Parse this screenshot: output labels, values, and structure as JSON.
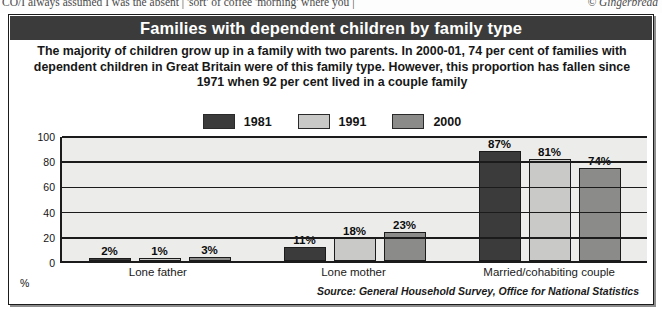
{
  "clipped_text": {
    "left": "CO/I always assumed I was the absent  |  'sort' of coffee 'morning' where you  |",
    "right": "© Gingerbread"
  },
  "headline": "Families with dependent children by family type",
  "standfirst": "The majority of children grow up in a family with two parents. In 2000-01, 74 per cent of families with dependent children in Great Britain were of this family type. However, this proportion has fallen since 1971 when 92 per cent lived in a couple family",
  "source": "Source: General Household Survey, Office for National Statistics",
  "colors": {
    "series_1981": "#3b3b3b",
    "series_1991": "#c9c9c7",
    "series_2000": "#8b8b8a",
    "headline_bar": "#3b3b3b",
    "plot_background": "#ececeb",
    "axis": "#1b1b1b"
  },
  "chart_data": {
    "type": "bar",
    "title": "Families with dependent children by family type",
    "xlabel": "",
    "ylabel": "%",
    "ylim": [
      0,
      100
    ],
    "yticks": [
      100,
      80,
      60,
      40,
      20,
      0
    ],
    "grid": true,
    "legend_position": "top-center",
    "categories": [
      "Lone father",
      "Lone mother",
      "Married/cohabiting couple"
    ],
    "series": [
      {
        "name": "1981",
        "values": [
          2,
          11,
          87
        ],
        "labels": [
          "2%",
          "11%",
          "87%"
        ]
      },
      {
        "name": "1991",
        "values": [
          1,
          18,
          81
        ],
        "labels": [
          "1%",
          "18%",
          "81%"
        ]
      },
      {
        "name": "2000",
        "values": [
          3,
          23,
          74
        ],
        "labels": [
          "3%",
          "23%",
          "74%"
        ]
      }
    ]
  }
}
